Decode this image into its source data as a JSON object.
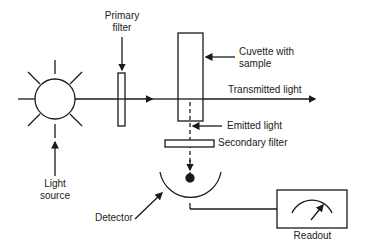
{
  "diagram": {
    "labels": {
      "primary_filter": [
        "Primary",
        "filter"
      ],
      "cuvette": [
        "Cuvette with",
        "sample"
      ],
      "transmitted": "Transmitted light",
      "emitted": "Emitted light",
      "secondary_filter": "Secondary filter",
      "light_source": [
        "Light",
        "source"
      ],
      "detector": "Detector",
      "readout": "Readout"
    },
    "colors": {
      "stroke": "#1a1a1a",
      "text": "#222222",
      "background": "#ffffff"
    }
  }
}
